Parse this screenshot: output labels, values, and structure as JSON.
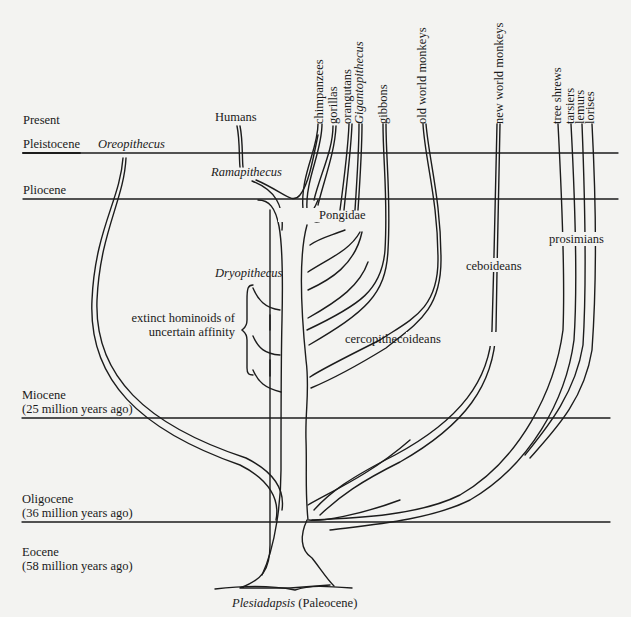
{
  "diagram": {
    "epochs": [
      {
        "name": "Present",
        "age": ""
      },
      {
        "name": "Pleistocene",
        "age": ""
      },
      {
        "name": "Pliocene",
        "age": ""
      },
      {
        "name": "Miocene",
        "age": "(25 million years ago)"
      },
      {
        "name": "Oligocene",
        "age": "(36 million years ago)"
      },
      {
        "name": "Eocene",
        "age": "(58 million years ago)"
      }
    ],
    "taxa_top": [
      {
        "label": "chimpanzees",
        "italic": false
      },
      {
        "label": "gorillas",
        "italic": false
      },
      {
        "label": "orangutans",
        "italic": false
      },
      {
        "label": "Gigantopithecus",
        "italic": true
      },
      {
        "label": "gibbons",
        "italic": false
      },
      {
        "label": "old world monkeys",
        "italic": false
      },
      {
        "label": "new world monkeys",
        "italic": false
      },
      {
        "label": "tree shrews",
        "italic": false
      },
      {
        "label": "tarsiers",
        "italic": false
      },
      {
        "label": "lemurs",
        "italic": false
      },
      {
        "label": "lorises",
        "italic": false
      }
    ],
    "labels": {
      "humans": "Humans",
      "oreopithecus": "Oreopithecus",
      "ramapithecus": "Ramapithecus",
      "dryopithecus": "Dryopithecus",
      "pongidae": "Pongidae",
      "extinct_line1": "extinct hominoids of",
      "extinct_line2": "uncertain affinity",
      "cercopithecoideans": "cercopithecoideans",
      "ceboideans": "ceboideans",
      "prosimians": "prosimians",
      "root_genus": "Plesiadapsis",
      "root_epoch": "(Paleocene)"
    }
  }
}
